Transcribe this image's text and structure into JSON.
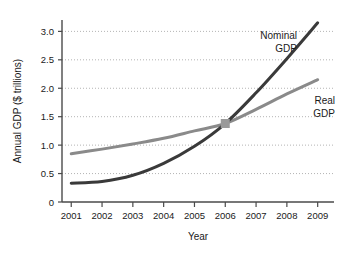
{
  "chart_data": {
    "type": "line",
    "title": "",
    "xlabel": "Year",
    "ylabel": "Annual GDP ($ trillions)",
    "x": [
      2001,
      2002,
      2003,
      2004,
      2005,
      2006,
      2007,
      2008,
      2009
    ],
    "xtick_labels": [
      "2001",
      "2002",
      "2003",
      "2004",
      "2005",
      "2006",
      "2007",
      "2008",
      "2009"
    ],
    "ytick_labels": [
      "0",
      "0.5",
      "1.0",
      "1.5",
      "2.0",
      "2.5",
      "3.0"
    ],
    "ytick_values": [
      0,
      0.5,
      1.0,
      1.5,
      2.0,
      2.5,
      3.0
    ],
    "xlim": [
      2000.7,
      2009.4
    ],
    "ylim": [
      0,
      3.2
    ],
    "grid": "horizontal-dotted",
    "legend": "inline-annotations",
    "series": [
      {
        "name": "Nominal GDP",
        "label_line1": "Nominal",
        "label_line2": "GDP",
        "color": "#3a3a3a",
        "values": [
          0.33,
          0.36,
          0.47,
          0.68,
          0.98,
          1.38,
          1.92,
          2.52,
          3.15
        ]
      },
      {
        "name": "Real GDP",
        "label_line1": "Real",
        "label_line2": "GDP",
        "color": "#8a8a8a",
        "values": [
          0.85,
          0.93,
          1.02,
          1.12,
          1.25,
          1.38,
          1.63,
          1.9,
          2.15
        ]
      }
    ],
    "annotations": [
      {
        "name": "crossing-point",
        "x": 2006,
        "y": 1.38,
        "color": "#9a9a9a",
        "note": "Nominal and Real GDP intersect"
      }
    ],
    "colors": {
      "axis": "#4a4a4a",
      "grid": "#b4b4b4",
      "text": "#1a1a1a",
      "background": "#ffffff"
    }
  }
}
